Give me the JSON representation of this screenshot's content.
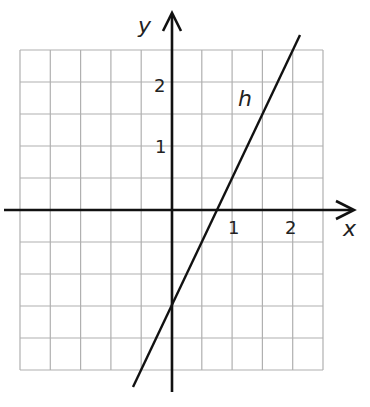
{
  "chart_data": {
    "type": "line",
    "title": "",
    "xlabel": "x",
    "ylabel": "y",
    "xlim": [
      -2.5,
      2.5
    ],
    "ylim": [
      -2.5,
      2.5
    ],
    "grid": true,
    "grid_step": 0.5,
    "x_ticks": [
      {
        "value": 1,
        "label": "1"
      },
      {
        "value": 2,
        "label": "2"
      }
    ],
    "y_ticks": [
      {
        "value": 1,
        "label": "1"
      },
      {
        "value": 2,
        "label": "2"
      }
    ],
    "series": [
      {
        "name": "h",
        "equation": "y = 2x - 1.5",
        "slope": 2,
        "y_intercept": -1.5,
        "x_intercept": 0.75,
        "x": [
          -0.65,
          2.1
        ],
        "y": [
          -2.8,
          2.7
        ]
      }
    ],
    "legend": "inline label 'h' near line"
  },
  "labels": {
    "x_axis": "x",
    "y_axis": "y",
    "line": "h",
    "tick_x1": "1",
    "tick_x2": "2",
    "tick_y1": "1",
    "tick_y2": "2"
  },
  "colors": {
    "grid": "#b0b0b0",
    "axis": "#111111",
    "line": "#111111"
  }
}
